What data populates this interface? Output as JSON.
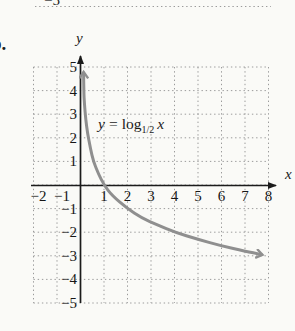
{
  "page": {
    "background": "#fafaf7",
    "text_color": "#1b1b1b"
  },
  "previous_figure_fragment": {
    "tick_label": "−5"
  },
  "problem_label": "b.",
  "figure": {
    "y_axis_label": "y",
    "x_axis_label": "x",
    "equation": {
      "var": "y",
      "equals": "=",
      "operator": "log",
      "base": "1/2",
      "argument": "x"
    },
    "x_tick_labels": [
      "−2",
      "−1",
      "1",
      "2",
      "3",
      "4",
      "5",
      "6",
      "7",
      "8"
    ],
    "y_tick_labels": [
      "5",
      "4",
      "3",
      "2",
      "1",
      "−1",
      "−2",
      "−3",
      "−4",
      "−5"
    ],
    "colors": {
      "curve": "#8f8f8f",
      "axis": "#1b1b1b",
      "grid": "#9b9b9b"
    }
  },
  "chart_data": {
    "type": "line",
    "xlabel": "x",
    "ylabel": "y",
    "xlim": [
      -2,
      8
    ],
    "ylim": [
      -5,
      5
    ],
    "grid": true,
    "legend": "none",
    "x_ticks": [
      -2,
      -1,
      1,
      2,
      3,
      4,
      5,
      6,
      7,
      8
    ],
    "y_ticks": [
      5,
      4,
      3,
      2,
      1,
      -1,
      -2,
      -3,
      -4,
      -5
    ],
    "series": [
      {
        "name": "y = log_(1/2) x",
        "function": "y equals log base one-half of x",
        "points": [
          [
            0.13,
            4.75
          ],
          [
            0.14,
            4.0
          ],
          [
            0.17,
            3.4
          ],
          [
            0.22,
            2.8
          ],
          [
            0.3,
            2.2
          ],
          [
            0.42,
            1.55
          ],
          [
            0.55,
            1.0
          ],
          [
            0.75,
            0.5
          ],
          [
            1,
            0
          ],
          [
            1.35,
            -0.45
          ],
          [
            2,
            -1
          ],
          [
            2.6,
            -1.4
          ],
          [
            3.3,
            -1.7
          ],
          [
            4,
            -2
          ],
          [
            5,
            -2.3
          ],
          [
            6,
            -2.58
          ],
          [
            7,
            -2.8
          ],
          [
            7.7,
            -2.95
          ]
        ]
      }
    ],
    "key_points": [
      [
        1,
        0
      ],
      [
        2,
        -1
      ],
      [
        4,
        -2
      ],
      [
        8,
        -3
      ]
    ]
  }
}
